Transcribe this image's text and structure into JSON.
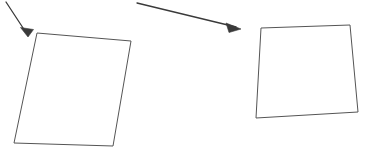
{
  "canvas": {
    "width": 368,
    "height": 151,
    "background_color": "#ffffff",
    "stroke_color": "#555555",
    "arrow_color": "#3a3a3a"
  },
  "diagram": {
    "shapes": [
      {
        "name": "left-quadrilateral",
        "points": "37,33 131,41 113,146 14,143",
        "closed": true,
        "corners": [
          {
            "label": "top-left",
            "x": 37,
            "y": 33
          },
          {
            "label": "top-right",
            "x": 131,
            "y": 41
          },
          {
            "label": "bottom-right",
            "x": 113,
            "y": 146
          },
          {
            "label": "bottom-left",
            "x": 14,
            "y": 143
          }
        ]
      },
      {
        "name": "right-quadrilateral",
        "points": "261,28 350,25 358,112 256,118",
        "closed": true,
        "corners": [
          {
            "label": "top-left",
            "x": 261,
            "y": 28
          },
          {
            "label": "top-right",
            "x": 350,
            "y": 25
          },
          {
            "label": "bottom-right",
            "x": 358,
            "y": 112
          },
          {
            "label": "bottom-left",
            "x": 256,
            "y": 118
          }
        ]
      }
    ],
    "arrows": [
      {
        "name": "left-arrow",
        "shaft": "6,2 27,34",
        "tip": {
          "x": 28,
          "y": 37
        },
        "head": "28,37 20.5,27.5 33.5,29.5",
        "direction": "down-right",
        "points_to": "left-quadrilateral"
      },
      {
        "name": "right-arrow",
        "shaft": "137,3 236,27",
        "tip": {
          "x": 241,
          "y": 29
        },
        "head": "241,29 226,23 229,32.5",
        "direction": "right-down",
        "points_to": "right-quadrilateral"
      }
    ]
  }
}
